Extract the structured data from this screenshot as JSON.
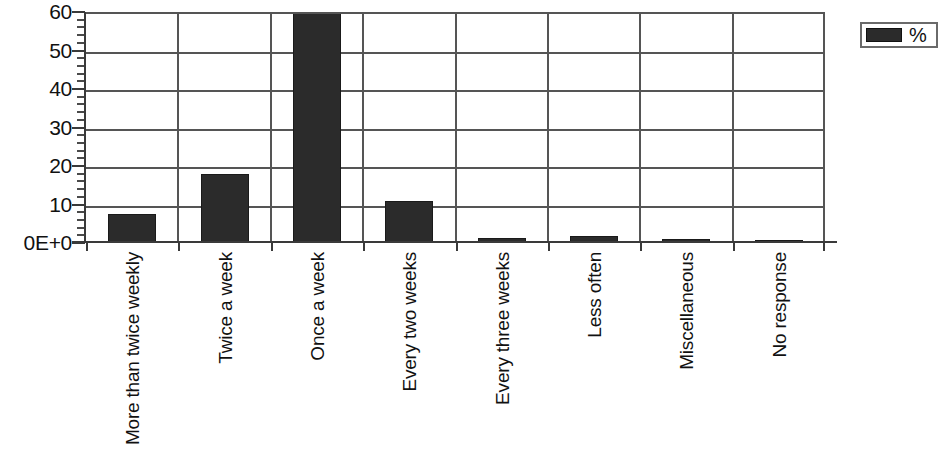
{
  "chart_data": {
    "type": "bar",
    "title": "",
    "xlabel": "",
    "ylabel": "",
    "categories": [
      "More than twice weekly",
      "Twice a week",
      "Once a week",
      "Every two weeks",
      "Every three weeks",
      "Less often",
      "Miscellaneous",
      "No response"
    ],
    "series": [
      {
        "name": "%",
        "values": [
          7.6,
          17.8,
          62,
          11,
          1.3,
          1.8,
          1.1,
          0.9
        ]
      }
    ],
    "values": [
      7.6,
      17.8,
      62,
      11,
      1.3,
      1.8,
      1.1,
      0.9
    ],
    "ylim": [
      0,
      60
    ],
    "y_ticks": [
      0,
      10,
      20,
      30,
      40,
      50,
      60
    ],
    "y_tick_labels": [
      "0E+0",
      "10",
      "20",
      "30",
      "40",
      "50",
      "60"
    ],
    "y_minor_tick_step": 2,
    "grid": true,
    "grid_axes": "both",
    "clipped_bars": [
      "Once a week"
    ],
    "legend": {
      "position": "right",
      "entries": [
        {
          "label": "%",
          "color": "#2b2b2b"
        }
      ]
    },
    "colors": {
      "bar": "#2b2b2b",
      "grid": "#555555",
      "axis": "#3a3a3a",
      "background": "#ffffff",
      "text": "#111111"
    }
  }
}
